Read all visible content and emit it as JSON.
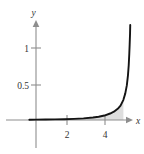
{
  "chart_data": {
    "type": "line",
    "title": "",
    "subtitle": "",
    "xlabel": "x",
    "ylabel": "y",
    "xlim": [
      -0.4,
      5.7
    ],
    "ylim": [
      -0.22,
      1.4
    ],
    "grid": false,
    "legend": null,
    "x_ticks": [
      {
        "value": 2,
        "label": "2"
      },
      {
        "value": 4,
        "label": "4"
      }
    ],
    "y_ticks": [
      {
        "value": 0.5,
        "label": "0.5"
      },
      {
        "value": 1,
        "label": "1"
      }
    ],
    "series": [
      {
        "name": "curve",
        "color": "#141414",
        "description": "increasing convex curve hugging the x-axis then rising steeply toward a vertical asymptote near x = 5",
        "x": [
          -0.35,
          0,
          0.5,
          1,
          1.5,
          2,
          2.5,
          3,
          3.3,
          3.6,
          3.9,
          4.1,
          4.3,
          4.45,
          4.6,
          4.7,
          4.78,
          4.84,
          4.88,
          4.91,
          4.93,
          4.95,
          4.96
        ],
        "y": [
          0.004,
          0.005,
          0.006,
          0.008,
          0.011,
          0.015,
          0.022,
          0.034,
          0.045,
          0.062,
          0.09,
          0.115,
          0.155,
          0.2,
          0.28,
          0.37,
          0.48,
          0.62,
          0.76,
          0.92,
          1.05,
          1.2,
          1.32
        ]
      }
    ],
    "shaded_region": {
      "color": "#d8d8d8",
      "x_start": 0,
      "x_end": 4.6,
      "description": "light gray area between the curve and the x-axis"
    }
  },
  "labels": {
    "y_axis_name": "y",
    "x_axis_name": "x",
    "y_tick_1": "1",
    "y_tick_05": "0.5",
    "x_tick_2": "2",
    "x_tick_4": "4"
  },
  "colors": {
    "curve": "#141414",
    "axis": "#8e8e8e",
    "shade": "#d8d8d8",
    "background": "#ffffff",
    "text": "#333333"
  }
}
